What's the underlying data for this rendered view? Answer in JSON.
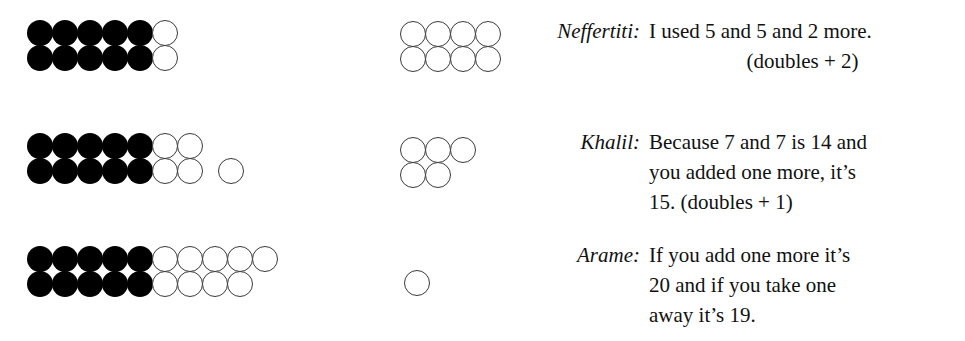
{
  "page": {
    "background_color": "#ffffff",
    "text_color": "#111111",
    "filled_dot_color": "#000000",
    "open_dot_stroke_color": "#3a3a3a"
  },
  "rows": [
    {
      "id": "row-neffertiti",
      "ten_frame": {
        "description": "double ten-frame, 5 columns of two filled dots then 1 column of two open dots",
        "columns": [
          {
            "top": "filled",
            "bottom": "filled"
          },
          {
            "top": "filled",
            "bottom": "filled"
          },
          {
            "top": "filled",
            "bottom": "filled"
          },
          {
            "top": "filled",
            "bottom": "filled"
          },
          {
            "top": "filled",
            "bottom": "filled"
          },
          {
            "top": "open",
            "bottom": "open"
          }
        ],
        "filled_count": 10,
        "open_count": 2,
        "total_count": 12
      },
      "right_group": {
        "description": "array of open dots",
        "columns": [
          {
            "top": "open",
            "bottom": "open"
          },
          {
            "top": "open",
            "bottom": "open"
          },
          {
            "top": "open",
            "bottom": "open"
          },
          {
            "top": "open",
            "bottom": "open"
          }
        ],
        "open_count": 8
      },
      "speech": {
        "speaker": "Neffertiti:",
        "lines": [
          "I used 5 and 5 and 2 more.",
          "(doubles + 2)"
        ],
        "text": "I used 5 and 5 and 2 more. (doubles + 2)"
      }
    },
    {
      "id": "row-khalil",
      "ten_frame": {
        "description": "double ten-frame, 5 columns filled, 2 columns open, plus 1 detached open dot on bottom row",
        "columns": [
          {
            "top": "filled",
            "bottom": "filled"
          },
          {
            "top": "filled",
            "bottom": "filled"
          },
          {
            "top": "filled",
            "bottom": "filled"
          },
          {
            "top": "filled",
            "bottom": "filled"
          },
          {
            "top": "filled",
            "bottom": "filled"
          },
          {
            "top": "open",
            "bottom": "open"
          },
          {
            "top": "open",
            "bottom": "open"
          }
        ],
        "detached": [
          {
            "row": "bottom",
            "state": "open"
          }
        ],
        "filled_count": 10,
        "open_count": 5,
        "total_count": 15
      },
      "right_group": {
        "description": "array of open dots, 3 on top row and 2 on bottom row",
        "columns": [
          {
            "top": "open",
            "bottom": "open"
          },
          {
            "top": "open",
            "bottom": "open"
          },
          {
            "top": "open",
            "bottom": null
          }
        ],
        "open_count": 5
      },
      "speech": {
        "speaker": "Khalil:",
        "lines": [
          "Because 7 and 7 is 14 and",
          "you added one more, it’s",
          "15. (doubles + 1)"
        ],
        "text": "Because 7 and 7 is 14 and you added one more, it’s 15. (doubles + 1)"
      }
    },
    {
      "id": "row-arame",
      "ten_frame": {
        "description": "double ten-frame, 5 columns filled, 4 columns open, plus 1 open dot on top row only",
        "columns": [
          {
            "top": "filled",
            "bottom": "filled"
          },
          {
            "top": "filled",
            "bottom": "filled"
          },
          {
            "top": "filled",
            "bottom": "filled"
          },
          {
            "top": "filled",
            "bottom": "filled"
          },
          {
            "top": "filled",
            "bottom": "filled"
          },
          {
            "top": "open",
            "bottom": "open"
          },
          {
            "top": "open",
            "bottom": "open"
          },
          {
            "top": "open",
            "bottom": "open"
          },
          {
            "top": "open",
            "bottom": "open"
          },
          {
            "top": "open",
            "bottom": null
          }
        ],
        "filled_count": 10,
        "open_count": 9,
        "total_count": 19
      },
      "right_group": {
        "description": "a single open dot",
        "columns": [
          {
            "top": null,
            "bottom": "open"
          }
        ],
        "open_count": 1
      },
      "speech": {
        "speaker": "Arame:",
        "lines": [
          "If you add one more it’s",
          "20 and if you take one",
          "away it’s 19."
        ],
        "text": "If you add one more it’s 20 and if you take one away it’s 19."
      }
    }
  ]
}
